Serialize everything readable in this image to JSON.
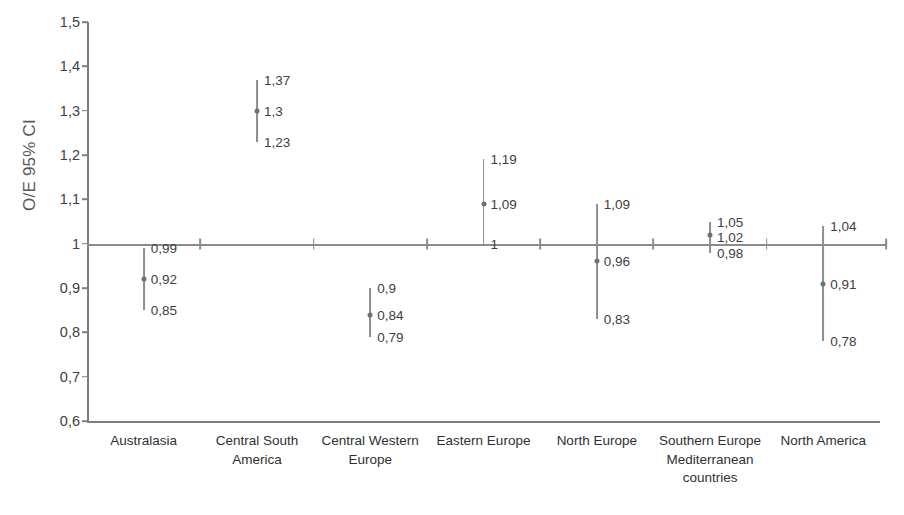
{
  "chart_data": {
    "type": "scatter",
    "subtype": "forest-plot-error-bars",
    "title": "",
    "xlabel": "",
    "ylabel": "O/E 95% CI",
    "ylim": [
      0.6,
      1.5
    ],
    "ytick_labels": [
      "1,5",
      "1,4",
      "1,3",
      "1,2",
      "1,1",
      "1",
      "0,9",
      "0,8",
      "0,7",
      "0,6"
    ],
    "ytick_values": [
      1.5,
      1.4,
      1.3,
      1.2,
      1.1,
      1.0,
      0.9,
      0.8,
      0.7,
      0.6
    ],
    "grid": false,
    "legend": "none",
    "reference_line": 1.0,
    "categories": [
      "Australasia",
      "Central South\nAmerica",
      "Central Western\nEurope",
      "Eastern Europe",
      "North Europe",
      "Southern Europe\nMediterranean\ncountries",
      "North America"
    ],
    "series": [
      {
        "name": "O/E ratio",
        "values": [
          0.92,
          1.3,
          0.84,
          1.09,
          0.96,
          1.02,
          0.91
        ],
        "ci_lower": [
          0.85,
          1.23,
          0.79,
          1.0,
          0.83,
          0.98,
          0.78
        ],
        "ci_upper": [
          0.99,
          1.37,
          0.9,
          1.19,
          1.09,
          1.05,
          1.04
        ],
        "value_labels": [
          "0,92",
          "1,3",
          "0,84",
          "1,09",
          "0,96",
          "1,02",
          "0,91"
        ],
        "ci_lower_labels": [
          "0,85",
          "1,23",
          "0,79",
          "1",
          "0,83",
          "0,98",
          "0,78"
        ],
        "ci_upper_labels": [
          "0,99",
          "1,37",
          "0,9",
          "1,19",
          "1,09",
          "1,05",
          "1,04"
        ]
      }
    ]
  },
  "colors": {
    "axis": "#7d7e80",
    "marker": "#6f7072",
    "error_bar": "#8d8e90",
    "text": "#3f4042",
    "axis_title": "#58595b",
    "background": "#ffffff"
  }
}
